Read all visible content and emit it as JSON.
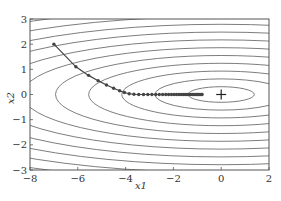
{
  "chart_data": {
    "type": "line",
    "title": "",
    "xlabel": "x1",
    "ylabel": "x2",
    "xlim": [
      -8,
      2
    ],
    "ylim": [
      -3,
      3
    ],
    "xticks": [
      -8,
      -6,
      -4,
      -2,
      0,
      2
    ],
    "yticks": [
      -3,
      -2,
      -1,
      0,
      1,
      2,
      3
    ],
    "xtick_labels": [
      "−8",
      "−6",
      "−4",
      "−2",
      "0",
      "2"
    ],
    "ytick_labels": [
      "−3",
      "−2",
      "−1",
      "0",
      "1",
      "2",
      "3"
    ],
    "grid": false,
    "contour": {
      "function": "f(x1, x2) = 0.1*x1^2 + 2*x2^2",
      "color": "#6e6e6e"
    },
    "minimum_marker": {
      "x": 0,
      "y": 0,
      "symbol": "+"
    },
    "series": [
      {
        "name": "trajectory",
        "color": "#444444",
        "points": [
          [
            -7.0,
            2.0
          ],
          [
            -6.08,
            1.1
          ],
          [
            -5.55,
            0.76
          ],
          [
            -5.15,
            0.55
          ],
          [
            -4.8,
            0.38
          ],
          [
            -4.5,
            0.25
          ],
          [
            -4.25,
            0.15
          ],
          [
            -4.05,
            0.08
          ],
          [
            -3.85,
            0.03
          ],
          [
            -3.65,
            0.01
          ],
          [
            -3.45,
            0.0
          ],
          [
            -3.25,
            0.0
          ],
          [
            -3.07,
            0.0
          ],
          [
            -2.9,
            0.0
          ],
          [
            -2.74,
            0.0
          ],
          [
            -2.59,
            0.0
          ],
          [
            -2.45,
            0.0
          ],
          [
            -2.32,
            0.0
          ],
          [
            -2.2,
            0.0
          ],
          [
            -2.08,
            0.0
          ],
          [
            -1.97,
            0.0
          ],
          [
            -1.87,
            0.0
          ],
          [
            -1.77,
            0.0
          ],
          [
            -1.68,
            0.0
          ],
          [
            -1.59,
            0.0
          ],
          [
            -1.51,
            0.0
          ],
          [
            -1.43,
            0.0
          ],
          [
            -1.36,
            0.0
          ],
          [
            -1.29,
            0.0
          ],
          [
            -1.22,
            0.0
          ],
          [
            -1.16,
            0.0
          ],
          [
            -1.1,
            0.0
          ],
          [
            -1.04,
            0.0
          ],
          [
            -0.99,
            0.0
          ],
          [
            -0.94,
            0.0
          ],
          [
            -0.89,
            0.0
          ],
          [
            -0.84,
            0.0
          ],
          [
            -0.8,
            0.0
          ]
        ]
      }
    ]
  }
}
